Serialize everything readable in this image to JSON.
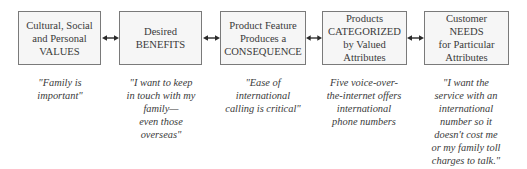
{
  "diagram": {
    "boxes": [
      {
        "label": "Cultural, Social\nand Personal\nVALUES"
      },
      {
        "label": "Desired\nBENEFITS"
      },
      {
        "label": "Product Feature\nProduces a\nCONSEQUENCE"
      },
      {
        "label": "Products\nCATEGORIZED\nby Valued\nAttributes"
      },
      {
        "label": "Customer\nNEEDS\nfor Particular\nAttributes"
      }
    ],
    "captions": [
      {
        "text": "\"Family is\nimportant\""
      },
      {
        "text": "\"I want to keep\nin touch with my\nfamily—\neven those\noverseas\""
      },
      {
        "text": "\"Ease of\ninternational\ncalling is critical\""
      },
      {
        "text": "Five voice-over-\nthe-internet offers\ninternational\nphone numbers"
      },
      {
        "text": "\"I want the\nservice with an\ninternational\nnumber so it\ndoesn't cost me\nor my family toll\ncharges to talk.\""
      }
    ],
    "connectors": [
      {
        "type": "double-arrow",
        "from": 0,
        "to": 1
      },
      {
        "type": "double-arrow",
        "from": 1,
        "to": 2
      },
      {
        "type": "double-arrow",
        "from": 2,
        "to": 3
      },
      {
        "type": "double-arrow",
        "from": 3,
        "to": 4
      }
    ],
    "colors": {
      "box_border": "#7a7a7a",
      "box_fill": "#f6f6f6",
      "text": "#3a3a3a",
      "arrow": "#2a2a2a"
    }
  }
}
